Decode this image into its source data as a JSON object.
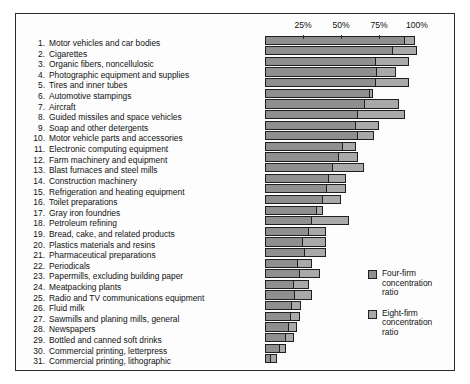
{
  "chart_data": {
    "type": "bar",
    "orientation": "horizontal",
    "title": "",
    "xlabel": "",
    "ylabel": "",
    "xlim": [
      0,
      100
    ],
    "grid": false,
    "legend_position": "inside-right-lower",
    "axis_ticks": [
      {
        "value": 25,
        "label": "25%"
      },
      {
        "value": 50,
        "label": "50%"
      },
      {
        "value": 75,
        "label": "75%"
      },
      {
        "value": 100,
        "label": "100%"
      }
    ],
    "legend": [
      {
        "name": "Four-firm concentration ratio",
        "line1": "Four-firm",
        "line2": "concentration",
        "line3": "ratio",
        "color": "#8f8f8f"
      },
      {
        "name": "Eight-firm concentration ratio",
        "line1": "Eight-firm",
        "line2": "concentration",
        "line3": "ratio",
        "color": "#a9a9a9"
      }
    ],
    "series": [
      {
        "name": "Four-firm concentration ratio",
        "color": "#8f8f8f",
        "values": [
          92,
          84,
          73,
          74,
          73,
          69,
          66,
          61,
          60,
          61,
          51,
          49,
          45,
          42,
          41,
          38,
          34,
          31,
          29,
          25,
          26,
          22,
          23,
          19,
          20,
          18,
          17,
          16,
          14,
          10,
          4
        ]
      },
      {
        "name": "Eight-firm concentration ratio",
        "color": "#a9a9a9",
        "values": [
          99,
          100,
          95,
          86,
          95,
          71,
          88,
          92,
          75,
          72,
          60,
          61,
          65,
          53,
          53,
          50,
          38,
          55,
          40,
          40,
          40,
          31,
          36,
          29,
          31,
          24,
          23,
          21,
          19,
          14,
          8
        ]
      }
    ],
    "categories": [
      "Motor vehicles and car bodies",
      "Cigarettes",
      "Organic fibers, noncellulosic",
      "Photographic equipment and supplies",
      "Tires and inner tubes",
      "Automotive stampings",
      "Aircraft",
      "Guided missiles and space vehicles",
      "Soap and other detergents",
      "Motor vehicle parts and accessories",
      "Electronic computing equipment",
      "Farm machinery and equipment",
      "Blast furnaces and steel mills",
      "Construction machinery",
      "Refrigeration and heating equipment",
      "Toilet preparations",
      "Gray iron foundries",
      "Petroleum refining",
      "Bread, cake, and related products",
      "Plastics materials and resins",
      "Pharmaceutical preparations",
      "Periodicals",
      "Papermills, excluding building paper",
      "Meatpacking plants",
      "Radio and TV communications equipment",
      "Fluid milk",
      "Sawmills and planing mills, general",
      "Newspapers",
      "Bottled and canned soft drinks",
      "Commercial printing, letterpress",
      "Commercial printing, lithographic"
    ],
    "numbered_categories": [
      {
        "num": "1.",
        "label": "Motor vehicles and car bodies"
      },
      {
        "num": "2.",
        "label": "Cigarettes"
      },
      {
        "num": "3.",
        "label": "Organic fibers, noncellulosic"
      },
      {
        "num": "4.",
        "label": "Photographic equipment and supplies"
      },
      {
        "num": "5.",
        "label": "Tires and inner tubes"
      },
      {
        "num": "6.",
        "label": "Automotive stampings"
      },
      {
        "num": "7.",
        "label": "Aircraft"
      },
      {
        "num": "8.",
        "label": "Guided missiles and space vehicles"
      },
      {
        "num": "9.",
        "label": "Soap and other detergents"
      },
      {
        "num": "10.",
        "label": "Motor vehicle parts and accessories"
      },
      {
        "num": "11.",
        "label": "Electronic computing equipment"
      },
      {
        "num": "12.",
        "label": "Farm machinery and equipment"
      },
      {
        "num": "13.",
        "label": "Blast furnaces and steel mills"
      },
      {
        "num": "14.",
        "label": "Construction machinery"
      },
      {
        "num": "15.",
        "label": "Refrigeration and heating equipment"
      },
      {
        "num": "16.",
        "label": "Toilet preparations"
      },
      {
        "num": "17.",
        "label": "Gray iron foundries"
      },
      {
        "num": "18.",
        "label": "Petroleum refining"
      },
      {
        "num": "19.",
        "label": "Bread, cake, and related products"
      },
      {
        "num": "20.",
        "label": "Plastics materials and resins"
      },
      {
        "num": "21.",
        "label": "Pharmaceutical preparations"
      },
      {
        "num": "22.",
        "label": "Periodicals"
      },
      {
        "num": "23.",
        "label": "Papermills, excluding building paper"
      },
      {
        "num": "24.",
        "label": "Meatpacking plants"
      },
      {
        "num": "25.",
        "label": "Radio and TV communications equipment"
      },
      {
        "num": "26.",
        "label": "Fluid milk"
      },
      {
        "num": "27.",
        "label": "Sawmills and planing mills, general"
      },
      {
        "num": "28.",
        "label": "Newspapers"
      },
      {
        "num": "29.",
        "label": "Bottled and canned soft drinks"
      },
      {
        "num": "30.",
        "label": "Commercial printing, letterpress"
      },
      {
        "num": "31.",
        "label": "Commercial printing, lithographic"
      }
    ]
  }
}
